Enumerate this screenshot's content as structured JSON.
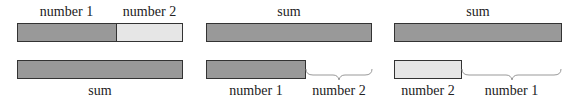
{
  "colors": {
    "dark_bar": "#999999",
    "light_bar": "#e6e6e6",
    "outline": "#333333",
    "brace": "#999999"
  },
  "panels": [
    {
      "top_labels": [
        "number 1",
        "number 2"
      ],
      "top_bar": {
        "segments": [
          "number 1",
          "number 2"
        ]
      },
      "bottom_bar": {
        "label": "sum"
      },
      "bottom_label": "sum"
    },
    {
      "top_label": "sum",
      "bottom_bar_label": "number 1",
      "brace_label": "number 2"
    },
    {
      "top_label": "sum",
      "bottom_bar_label": "number 2",
      "brace_label": "number 1"
    }
  ]
}
